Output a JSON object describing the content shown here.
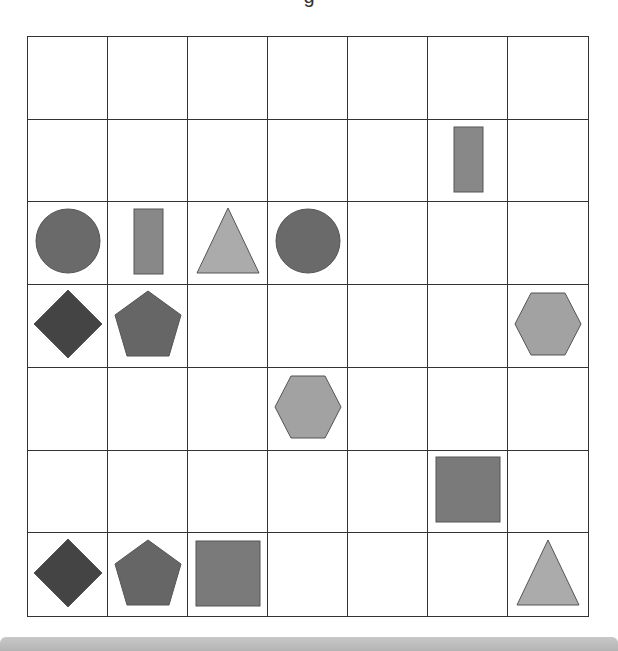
{
  "title": "g",
  "grid": {
    "rows": 7,
    "cols": 7,
    "cells": [
      {
        "row": 1,
        "col": 5,
        "shape": "rectangle",
        "color": "#888888"
      },
      {
        "row": 2,
        "col": 0,
        "shape": "circle",
        "color": "#6a6a6a"
      },
      {
        "row": 2,
        "col": 1,
        "shape": "rectangle",
        "color": "#888888"
      },
      {
        "row": 2,
        "col": 2,
        "shape": "triangle",
        "color": "#ababab"
      },
      {
        "row": 2,
        "col": 3,
        "shape": "circle",
        "color": "#6a6a6a"
      },
      {
        "row": 3,
        "col": 0,
        "shape": "diamond",
        "color": "#444444"
      },
      {
        "row": 3,
        "col": 1,
        "shape": "pentagon",
        "color": "#666666"
      },
      {
        "row": 3,
        "col": 6,
        "shape": "hexagon",
        "color": "#a2a2a2"
      },
      {
        "row": 4,
        "col": 3,
        "shape": "hexagon",
        "color": "#a2a2a2"
      },
      {
        "row": 5,
        "col": 5,
        "shape": "square",
        "color": "#7a7a7a"
      },
      {
        "row": 6,
        "col": 0,
        "shape": "diamond",
        "color": "#444444"
      },
      {
        "row": 6,
        "col": 1,
        "shape": "pentagon",
        "color": "#666666"
      },
      {
        "row": 6,
        "col": 2,
        "shape": "square",
        "color": "#7a7a7a"
      },
      {
        "row": 6,
        "col": 6,
        "shape": "triangle",
        "color": "#ababab"
      }
    ]
  },
  "stroke_color": "#555555"
}
